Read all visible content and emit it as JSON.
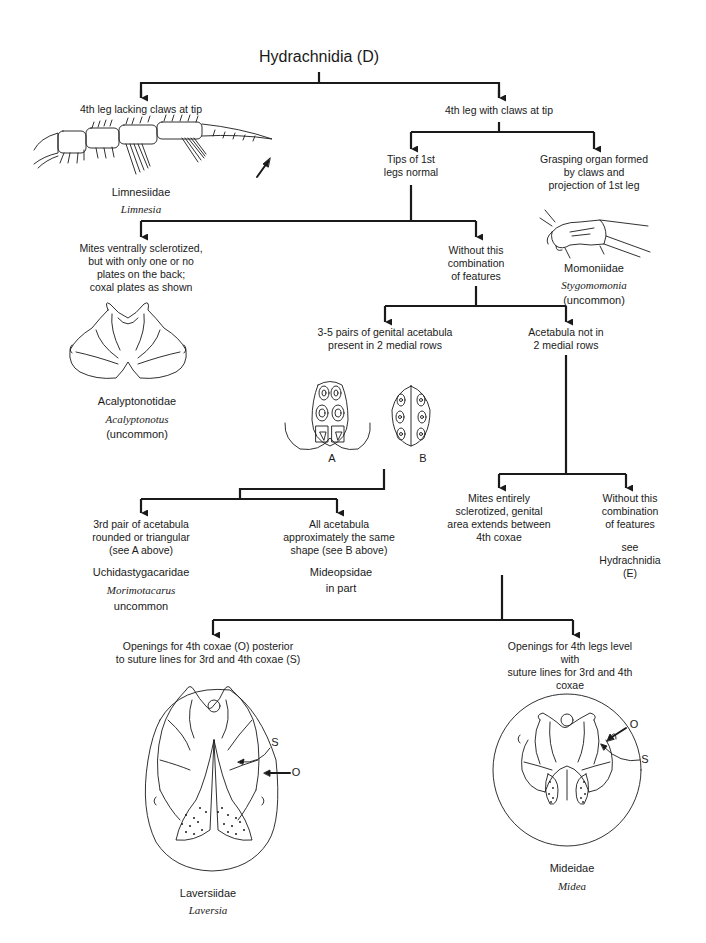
{
  "title": "Hydrachnidia (D)",
  "nodes": {
    "n1a": {
      "text": "4th leg lacking claws at tip"
    },
    "n1b": {
      "text": "4th leg with claws at tip"
    },
    "limnesiidae": {
      "family": "Limnesiidae",
      "genus": "Limnesia"
    },
    "n2a": {
      "text": "Tips of 1st\nlegs normal"
    },
    "n2b": {
      "text": "Grasping organ formed\nby claws and\nprojection of 1st leg"
    },
    "momoniidae": {
      "family": "Momoniidae",
      "genus": "Stygomomonia",
      "note": "(uncommon)"
    },
    "n3a": {
      "text": "Mites ventrally sclerotized,\nbut with only one or no\nplates on the back;\ncoxal plates as shown"
    },
    "n3b": {
      "text": "Without this\ncombination\nof features"
    },
    "acalyptonotidae": {
      "family": "Acalyptonotidae",
      "genus": "Acalyptonotus",
      "note": "(uncommon)"
    },
    "n4a": {
      "text": "3-5 pairs of genital acetabula\npresent in 2 medial rows"
    },
    "n4b": {
      "text": "Acetabula not in\n2 medial rows"
    },
    "fig_a": {
      "label": "A"
    },
    "fig_b": {
      "label": "B"
    },
    "n5a": {
      "text": "3rd pair of acetabula\nrounded or triangular\n(see A above)"
    },
    "n5b": {
      "text": "All acetabula\napproximately the same\nshape (see B above)"
    },
    "uchidastygacaridae": {
      "family": "Uchidastygacaridae",
      "genus": "Morimotacarus",
      "note": "uncommon"
    },
    "mideopsidae": {
      "family": "Mideopsidae",
      "note": "in part"
    },
    "n6a": {
      "text": "Mites entirely\nsclerotized, genital\narea extends between\n4th coxae"
    },
    "n6b": {
      "text": "Without this\ncombination\nof features"
    },
    "n6b_ref": {
      "text": "see Hydrachnidia (E)"
    },
    "n7a": {
      "text": "Openings for 4th coxae (O) posterior\nto suture lines for 3rd and 4th coxae (S)"
    },
    "n7b": {
      "text": "Openings for 4th legs level with\nsuture lines for 3rd and 4th coxae"
    },
    "laversiidae": {
      "family": "Laversiidae",
      "genus": "Laversia",
      "label_s": "S",
      "label_o": "O"
    },
    "mideidae": {
      "family": "Mideidae",
      "genus": "Midea",
      "label_s": "S",
      "label_o": "O"
    }
  },
  "colors": {
    "ink": "#1a1a1a",
    "background": "#ffffff"
  }
}
